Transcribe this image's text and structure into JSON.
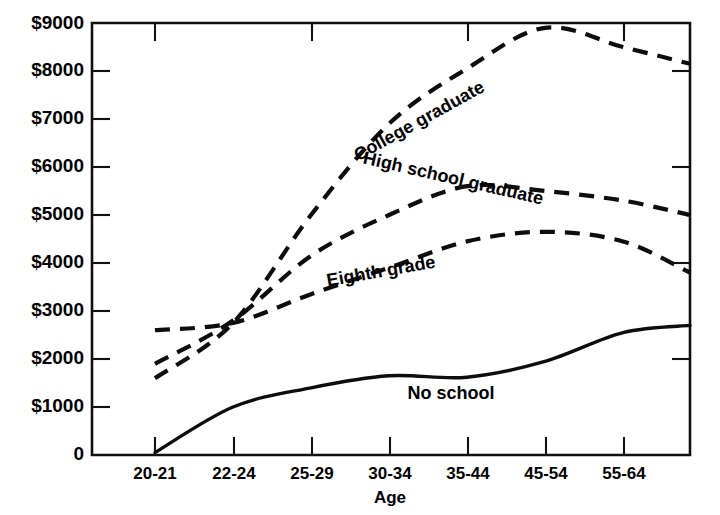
{
  "chart_data": {
    "type": "line",
    "title": "",
    "xlabel": "Age",
    "ylabel": "",
    "categories": [
      "20-21",
      "22-24",
      "25-29",
      "30-34",
      "35-44",
      "45-54",
      "55-64",
      "65+"
    ],
    "x_tick_labels": [
      "20-21",
      "22-24",
      "25-29",
      "30-34",
      "35-44",
      "45-54",
      "55-64"
    ],
    "y_tick_labels": [
      "$9000",
      "$8000",
      "$7000",
      "$6000",
      "$5000",
      "$4000",
      "$3000",
      "$2000",
      "$1000",
      "0"
    ],
    "y_tick_values": [
      9000,
      8000,
      7000,
      6000,
      5000,
      4000,
      3000,
      2000,
      1000,
      0
    ],
    "ylim": [
      0,
      9000
    ],
    "grid": false,
    "legend_position": "inline-labels",
    "series": [
      {
        "name": "College graduate",
        "style": "dashed",
        "values": [
          1600,
          2750,
          5000,
          6900,
          8050,
          8900,
          8500,
          8150
        ]
      },
      {
        "name": "High school graduate",
        "style": "dashed",
        "values": [
          1900,
          2800,
          4150,
          5000,
          5600,
          5500,
          5300,
          5000
        ]
      },
      {
        "name": "Eighth grade",
        "style": "dashed",
        "values": [
          2600,
          2750,
          3350,
          3900,
          4450,
          4650,
          4450,
          3800
        ]
      },
      {
        "name": "No school",
        "style": "solid",
        "values": [
          50,
          1000,
          1400,
          1650,
          1620,
          1950,
          2550,
          2700
        ]
      }
    ],
    "annotations": [
      {
        "text": "College graduate",
        "x": 422,
        "y": 126,
        "rotation": -29
      },
      {
        "text": "High school graduate",
        "x": 452,
        "y": 184,
        "rotation": 13
      },
      {
        "text": "Eighth grade",
        "x": 382,
        "y": 277,
        "rotation": -10
      },
      {
        "text": "No school",
        "x": 451,
        "y": 399,
        "rotation": 0
      }
    ],
    "colors": {
      "line": "#0d0d0d",
      "axis": "#111111",
      "background": "#ffffff"
    }
  }
}
